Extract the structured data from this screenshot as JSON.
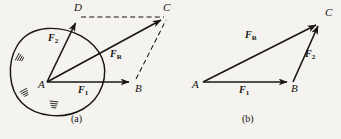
{
  "figure": {
    "caption_a": "(a)",
    "caption_b": "(b)",
    "ink_color": "#1a1713",
    "background_color": "#f4f3ef"
  },
  "panel_a": {
    "name": "parallelogram-law-on-rigid-body",
    "points": [
      {
        "id": "A",
        "label": "A",
        "x": 47,
        "y": 82
      },
      {
        "id": "B",
        "label": "B",
        "x": 135,
        "y": 82
      },
      {
        "id": "C",
        "label": "C",
        "x": 168,
        "y": 17
      },
      {
        "id": "D",
        "label": "D",
        "x": 79,
        "y": 17
      }
    ],
    "vectors": [
      {
        "id": "F1",
        "label": "F",
        "sub": "1",
        "from": "A",
        "to": "B",
        "style": "solid-arrow"
      },
      {
        "id": "F2",
        "label": "F",
        "sub": "2",
        "from": "A",
        "to": "D",
        "style": "solid-arrow"
      },
      {
        "id": "FR",
        "label": "F",
        "sub": "R",
        "from": "A",
        "to": "C",
        "style": "solid-arrow"
      }
    ],
    "construction_lines": [
      {
        "from": "D",
        "to": "C",
        "style": "dashed"
      },
      {
        "from": "B",
        "to": "C",
        "style": "dashed"
      }
    ],
    "body_outline": "closed irregular blob enclosing point A",
    "ground_hatch_marks": 3
  },
  "panel_b": {
    "name": "triangle-rule-construction",
    "points": [
      {
        "id": "A",
        "label": "A",
        "x": 203,
        "y": 82
      },
      {
        "id": "B",
        "label": "B",
        "x": 293,
        "y": 82
      },
      {
        "id": "C",
        "label": "C",
        "x": 322,
        "y": 22
      }
    ],
    "vectors": [
      {
        "id": "F1",
        "label": "F",
        "sub": "1",
        "from": "A",
        "to": "B",
        "style": "solid-arrow"
      },
      {
        "id": "F2",
        "label": "F",
        "sub": "2",
        "from": "B",
        "to": "C",
        "style": "solid-arrow"
      },
      {
        "id": "FR",
        "label": "F",
        "sub": "R",
        "from": "A",
        "to": "C",
        "style": "solid-arrow"
      }
    ]
  },
  "labels": {
    "a_F1": {
      "text": "F",
      "sub": "1",
      "x": 79,
      "y": 88
    },
    "a_F2": {
      "text": "F",
      "sub": "2",
      "x": 48,
      "y": 36
    },
    "a_FR": {
      "text": "F",
      "sub": "R",
      "x": 111,
      "y": 52
    },
    "a_A": {
      "text": "A",
      "x": 38,
      "y": 84
    },
    "a_B": {
      "text": "B",
      "x": 135,
      "y": 86
    },
    "a_C": {
      "text": "C",
      "x": 163,
      "y": 4
    },
    "a_D": {
      "text": "D",
      "x": 74,
      "y": 4
    },
    "b_F1": {
      "text": "F",
      "sub": "1",
      "x": 240,
      "y": 88
    },
    "b_F2": {
      "text": "F",
      "sub": "2",
      "x": 305,
      "y": 52
    },
    "b_FR": {
      "text": "F",
      "sub": "R",
      "x": 246,
      "y": 33
    },
    "b_A": {
      "text": "A",
      "x": 193,
      "y": 84
    },
    "b_B": {
      "text": "B",
      "x": 291,
      "y": 86
    },
    "b_C": {
      "text": "C",
      "x": 324,
      "y": 9
    },
    "cap_a": {
      "text": "(a)",
      "x": 72,
      "y": 118
    },
    "cap_b": {
      "text": "(b)",
      "x": 243,
      "y": 118
    }
  }
}
